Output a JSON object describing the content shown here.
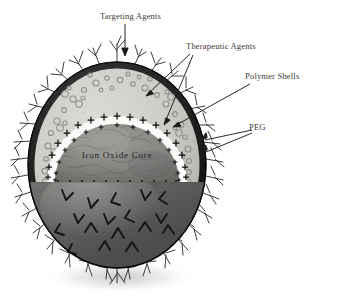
{
  "figure": {
    "background_color": "#ffffff",
    "width": 337,
    "height": 298
  },
  "labels": {
    "targeting_agents": "Targeting Agents",
    "therapeutic_agents": "Therapeutic Agents",
    "polymer_shells": "Polymer Shells",
    "peg": "PEG",
    "iron_oxide_core": "Iron Oxide Core"
  },
  "colors": {
    "background": "#ffffff",
    "outline": "#161616",
    "outer_membrane": "#1d1d1d",
    "polymer_shell": "#d2d0cb",
    "polymer_shell_dark": "#b9b7b1",
    "white_band": "#fbfbfa",
    "core_fill": "#8e8e8c",
    "core_fill_dark": "#6e6e6c",
    "lower_hemisphere": "#7b7b79",
    "lower_hemisphere_dark": "#5f5f5d",
    "peg_chain": "#1b1b1b",
    "charge_marker": "#101010",
    "label_text": "#3a3a3a",
    "shadow": "#c8c8c8"
  },
  "structure": {
    "sphere": {
      "cx": 117,
      "cy": 165,
      "rx": 89,
      "ry": 103
    },
    "cut_plane_y": 182,
    "layers": [
      {
        "name": "peg-corona",
        "label": "PEG"
      },
      {
        "name": "outer-membrane",
        "label": "Outer membrane"
      },
      {
        "name": "polymer-shell",
        "label": "Polymer Shells"
      },
      {
        "name": "charge-band",
        "label": "Charged interface"
      },
      {
        "name": "iron-oxide-core",
        "label": "Iron Oxide Core"
      }
    ],
    "therapeutic_agent_count": 46,
    "charge_marker_count": 34,
    "peg_chain_count": 34,
    "targeting_agent_count": 17
  },
  "annotations": [
    {
      "name": "targeting-agents",
      "text": "Targeting Agents",
      "arrows": 1
    },
    {
      "name": "therapeutic-agents",
      "text": "Therapeutic Agents",
      "arrows": 2
    },
    {
      "name": "polymer-shells",
      "text": "Polymer Shells",
      "arrows": 1
    },
    {
      "name": "peg",
      "text": "PEG",
      "arrows": 2
    }
  ]
}
